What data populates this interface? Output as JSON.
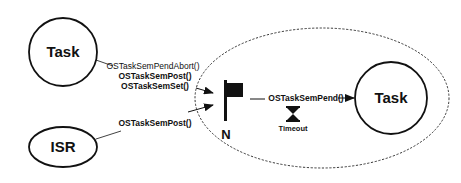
{
  "diagram": {
    "nodes": {
      "task_left": {
        "label": "Task"
      },
      "isr": {
        "label": "ISR"
      },
      "task_right": {
        "label": "Task"
      },
      "semaphore": {
        "label": "N"
      }
    },
    "edges": {
      "task_to_sem": {
        "labels": [
          "OSTaskSemPendAbort()",
          "OSTaskSemPost()",
          "OSTaskSemSet()"
        ]
      },
      "isr_to_sem": {
        "label": "OSTaskSemPost()"
      },
      "sem_to_task": {
        "label": "OSTaskSemPend()"
      }
    },
    "timeout": {
      "label": "Timeout",
      "icon": "hourglass-icon"
    },
    "semaphore_icon": "flag-icon",
    "colors": {
      "stroke": "#111111",
      "background": "#ffffff"
    }
  }
}
